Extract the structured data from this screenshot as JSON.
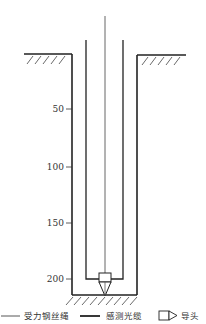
{
  "diagram": {
    "type": "borehole-sensing-cable-installation",
    "depth_axis": {
      "ticks": [
        {
          "label": "50",
          "y": 109
        },
        {
          "label": "100",
          "y": 167
        },
        {
          "label": "150",
          "y": 223
        },
        {
          "label": "200",
          "y": 279
        }
      ]
    },
    "elements": {
      "steel_wire_rope": "受力钢丝绳",
      "sensing_cable": "感测光缆",
      "guide_head": "导头"
    }
  },
  "legend": {
    "items": [
      {
        "symbol": "thin-line",
        "label": "受力钢丝绳"
      },
      {
        "symbol": "thick-line",
        "label": "感测光缆"
      },
      {
        "symbol": "guide-head-shape",
        "label": "导头"
      }
    ]
  },
  "colors": {
    "line": "#222222",
    "rope": "#555555",
    "hatch": "#444444"
  }
}
